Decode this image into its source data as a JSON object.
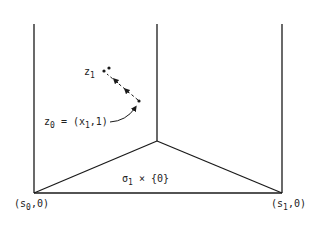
{
  "diagram": {
    "labels": {
      "z1": {
        "main": "z",
        "sub": "1"
      },
      "z0": {
        "main": "z",
        "sub": "0",
        "rest_a": " = (x",
        "rest_sub": "1",
        "rest_b": ",1)"
      },
      "sigma": {
        "main": "σ",
        "sub": "1",
        "rest": " × {0}"
      },
      "s0": {
        "a": "(s",
        "sub": "0",
        "b": ",0)"
      },
      "s1": {
        "a": "(s",
        "sub": "1",
        "b": ",0)"
      }
    },
    "colors": {
      "line": "#1a1a1a",
      "text": "#222222"
    }
  }
}
